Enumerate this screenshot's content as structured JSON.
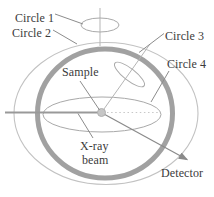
{
  "diagram": {
    "labels": {
      "circle1": "Circle 1",
      "circle2": "Circle 2",
      "circle3": "Circle 3",
      "circle4": "Circle 4",
      "sample": "Sample",
      "xray_line1": "X-ray",
      "xray_line2": "beam",
      "detector": "Detector"
    },
    "colors": {
      "background": "#ffffff",
      "text": "#3b3b3b",
      "thick_ring": "#a1a1a1",
      "thin_circle": "#c2c2c2",
      "ellipse_stroke": "#a9a9a9",
      "axis_line": "#b5b5b5",
      "leader_line": "#8c8c8c",
      "beam_line": "#999999",
      "dotted_line": "#c8c8c8",
      "arrow": "#8a8a8a",
      "sample_dot_fill": "#c6c6c6",
      "sample_dot_stroke": "#b0b0b0"
    }
  }
}
